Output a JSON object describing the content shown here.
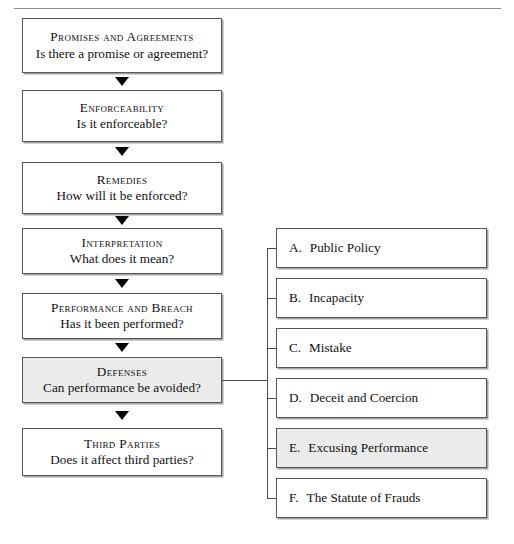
{
  "header": {
    "chapter_title": "II. CHOOSING THE CHAPTERS",
    "rule": "horizontal-rule"
  },
  "flow": {
    "steps": [
      {
        "title": "Promises and Agreements",
        "question": "Is there a promise or agreement?",
        "shaded": false
      },
      {
        "title": "Enforceability",
        "question": "Is it enforceable?",
        "shaded": false
      },
      {
        "title": "Remedies",
        "question": "How will it be enforced?",
        "shaded": false
      },
      {
        "title": "Interpretation",
        "question": "What does it mean?",
        "shaded": false
      },
      {
        "title": "Performance and Breach",
        "question": "Has it been performed?",
        "shaded": false
      },
      {
        "title": "Defenses",
        "question": "Can performance be avoided?",
        "shaded": true
      },
      {
        "title": "Third Parties",
        "question": "Does it affect third parties?",
        "shaded": false
      }
    ]
  },
  "options": {
    "items": [
      {
        "letter": "A.",
        "label": "Public Policy",
        "shaded": false
      },
      {
        "letter": "B.",
        "label": "Incapacity",
        "shaded": false
      },
      {
        "letter": "C.",
        "label": "Mistake",
        "shaded": false
      },
      {
        "letter": "D.",
        "label": "Deceit and Coercion",
        "shaded": false
      },
      {
        "letter": "E.",
        "label": "Excusing Performance",
        "shaded": true
      },
      {
        "letter": "F.",
        "label": "The Statute of Frauds",
        "shaded": false
      }
    ]
  },
  "colors": {
    "box_border": "#58585a",
    "box_fill": "#ffffff",
    "shaded_fill": "#ebebeb",
    "arrow": "#000000",
    "connector": "#4a4a4c",
    "text": "#111111"
  }
}
